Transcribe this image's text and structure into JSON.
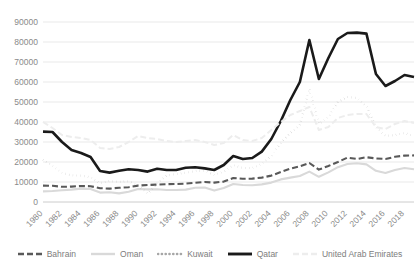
{
  "chart_data": {
    "type": "line",
    "title": "",
    "xlabel": "",
    "ylabel": "",
    "ylim": [
      0,
      90000
    ],
    "ytick_step": 10000,
    "yticks": [
      "0",
      "10000",
      "20000",
      "30000",
      "40000",
      "50000",
      "60000",
      "70000",
      "80000",
      "90000"
    ],
    "grid": true,
    "legend_position": "bottom",
    "x_tick_labels": [
      "1980",
      "1982",
      "1984",
      "1986",
      "1988",
      "1990",
      "1992",
      "1994",
      "1996",
      "1998",
      "2000",
      "2002",
      "2004",
      "2006",
      "2008",
      "2010",
      "2012",
      "2014",
      "2016",
      "2018"
    ],
    "x": [
      1980,
      1981,
      1982,
      1983,
      1984,
      1985,
      1986,
      1987,
      1988,
      1989,
      1990,
      1991,
      1992,
      1993,
      1994,
      1995,
      1996,
      1997,
      1998,
      1999,
      2000,
      2001,
      2002,
      2003,
      2004,
      2005,
      2006,
      2007,
      2008,
      2009,
      2010,
      2011,
      2012,
      2013,
      2014,
      2015,
      2016,
      2017,
      2018,
      2019
    ],
    "series": [
      {
        "name": "Bahrain",
        "style": "dashed",
        "color": "#595959",
        "width": 2.1,
        "dash": "6,3",
        "values": [
          8200,
          8100,
          7600,
          7700,
          8000,
          7900,
          6900,
          6700,
          7100,
          7400,
          8200,
          8500,
          8700,
          8900,
          9000,
          9200,
          9600,
          10000,
          9700,
          10200,
          12000,
          11600,
          11700,
          12200,
          13200,
          15000,
          16700,
          17800,
          19500,
          16200,
          18000,
          20000,
          22200,
          21500,
          22400,
          21800,
          21500,
          22600,
          23200,
          23300
        ]
      },
      {
        "name": "Oman",
        "style": "solid-light",
        "color": "#d9d9d9",
        "width": 2.1,
        "dash": "none",
        "values": [
          5300,
          5500,
          5900,
          6200,
          6700,
          6500,
          4700,
          4900,
          4300,
          5100,
          6500,
          6300,
          6400,
          6000,
          6000,
          6200,
          7100,
          7200,
          5700,
          7000,
          9000,
          8500,
          8400,
          8800,
          9700,
          11300,
          12200,
          13000,
          15200,
          12600,
          14800,
          17400,
          19000,
          19400,
          18800,
          15600,
          14500,
          16000,
          17000,
          16400
        ]
      },
      {
        "name": "Kuwait",
        "style": "dotted",
        "color": "#a6a6a6",
        "width": 2.2,
        "dash": "0.2,3.6",
        "values": [
          21000,
          18000,
          14500,
          13300,
          13200,
          12400,
          9400,
          10500,
          10000,
          10400,
          8300,
          4200,
          9200,
          13200,
          14000,
          14600,
          15500,
          15700,
          13500,
          15200,
          18400,
          17000,
          17000,
          19000,
          23000,
          29500,
          34500,
          38500,
          56500,
          39000,
          42500,
          50000,
          52500,
          52000,
          48000,
          37500,
          33000,
          33500,
          34500,
          33000
        ]
      },
      {
        "name": "Qatar",
        "style": "thick-solid",
        "color": "#1a1a1a",
        "width": 2.6,
        "dash": "none",
        "values": [
          35200,
          35000,
          30000,
          26000,
          24500,
          22500,
          15500,
          14700,
          15600,
          16400,
          16000,
          15200,
          16600,
          16000,
          16000,
          17100,
          17400,
          16800,
          16000,
          18500,
          23000,
          21500,
          22000,
          25200,
          31500,
          40500,
          51000,
          60000,
          81000,
          61500,
          72000,
          81500,
          84500,
          84700,
          84200,
          64000,
          58000,
          60500,
          63500,
          62500
        ]
      },
      {
        "name": "United Arab Emirates",
        "style": "dashed-faint",
        "color": "#ededed",
        "width": 2.0,
        "dash": "6,3",
        "values": [
          40000,
          37000,
          33500,
          32500,
          32000,
          31000,
          27000,
          26500,
          27500,
          30000,
          33000,
          32000,
          31500,
          30500,
          30000,
          30500,
          31000,
          30000,
          28500,
          29500,
          33500,
          31000,
          30500,
          32000,
          36000,
          40000,
          43500,
          45500,
          47500,
          36000,
          37500,
          42000,
          43500,
          44000,
          44000,
          37500,
          36500,
          39000,
          40500,
          39500
        ]
      }
    ]
  },
  "legend": {
    "items": [
      {
        "label": "Bahrain"
      },
      {
        "label": "Oman"
      },
      {
        "label": "Kuwait"
      },
      {
        "label": "Qatar"
      },
      {
        "label": "United Arab Emirates"
      }
    ]
  }
}
